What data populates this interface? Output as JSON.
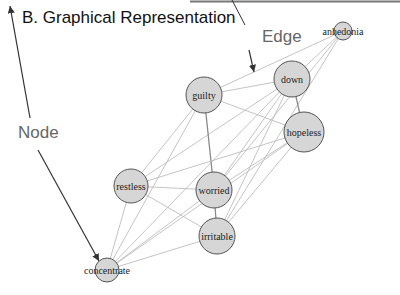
{
  "title": "B. Graphical Representation",
  "callouts": {
    "edge": "Edge",
    "node": "Node"
  },
  "colors": {
    "node_fill": "#d6d6d6",
    "node_stroke": "#555555",
    "edge": "#bdbdbd",
    "strong_edge": "#8a8a8a",
    "arrow": "#333333"
  },
  "nodes": [
    {
      "id": "anhedonia",
      "label": "anhedonia",
      "x": 343,
      "y": 31,
      "r": 9
    },
    {
      "id": "down",
      "label": "down",
      "x": 292,
      "y": 79,
      "r": 18
    },
    {
      "id": "guilty",
      "label": "guilty",
      "x": 204,
      "y": 95,
      "r": 18
    },
    {
      "id": "hopeless",
      "label": "hopeless",
      "x": 304,
      "y": 132,
      "r": 20
    },
    {
      "id": "restless",
      "label": "restless",
      "x": 131,
      "y": 186,
      "r": 17
    },
    {
      "id": "worried",
      "label": "worried",
      "x": 214,
      "y": 190,
      "r": 18
    },
    {
      "id": "irritable",
      "label": "irritable",
      "x": 217,
      "y": 236,
      "r": 18
    },
    {
      "id": "concentrate",
      "label": "concentrate",
      "x": 107,
      "y": 270,
      "r": 12
    }
  ],
  "edges": [
    [
      "anhedonia",
      "guilty"
    ],
    [
      "anhedonia",
      "down"
    ],
    [
      "anhedonia",
      "worried"
    ],
    [
      "anhedonia",
      "irritable"
    ],
    [
      "down",
      "guilty"
    ],
    [
      "down",
      "hopeless"
    ],
    [
      "down",
      "restless"
    ],
    [
      "down",
      "worried"
    ],
    [
      "down",
      "irritable"
    ],
    [
      "down",
      "concentrate"
    ],
    [
      "guilty",
      "hopeless"
    ],
    [
      "guilty",
      "worried"
    ],
    [
      "guilty",
      "restless"
    ],
    [
      "guilty",
      "concentrate"
    ],
    [
      "hopeless",
      "restless"
    ],
    [
      "hopeless",
      "worried"
    ],
    [
      "hopeless",
      "irritable"
    ],
    [
      "hopeless",
      "concentrate"
    ],
    [
      "restless",
      "worried"
    ],
    [
      "restless",
      "irritable"
    ],
    [
      "restless",
      "concentrate"
    ],
    [
      "worried",
      "irritable"
    ],
    [
      "worried",
      "concentrate"
    ],
    [
      "irritable",
      "concentrate"
    ]
  ]
}
